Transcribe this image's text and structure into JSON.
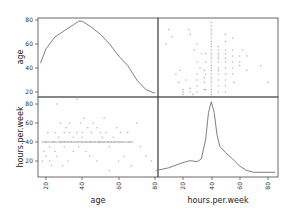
{
  "chart_data": {
    "type": "scatter_matrix",
    "variables": [
      "age",
      "hours.per.week"
    ],
    "grid": false,
    "panels": [
      {
        "position": "top-left",
        "type": "kde",
        "variable": "age",
        "ylabel": "age",
        "yticks": [
          20,
          40,
          60,
          80
        ],
        "curve": [
          [
            17,
            44
          ],
          [
            20,
            56
          ],
          [
            25,
            66
          ],
          [
            30,
            71
          ],
          [
            35,
            76
          ],
          [
            38,
            79
          ],
          [
            40,
            79
          ],
          [
            45,
            74
          ],
          [
            50,
            68
          ],
          [
            55,
            60
          ],
          [
            60,
            50
          ],
          [
            65,
            42
          ],
          [
            70,
            30
          ],
          [
            75,
            22
          ],
          [
            80,
            19
          ]
        ]
      },
      {
        "position": "top-right",
        "type": "scatter",
        "x": "hours.per.week",
        "y": "age",
        "points": [
          [
            8,
            60
          ],
          [
            10,
            72
          ],
          [
            12,
            66
          ],
          [
            15,
            35
          ],
          [
            17,
            28
          ],
          [
            18,
            38
          ],
          [
            20,
            22
          ],
          [
            20,
            18
          ],
          [
            20,
            20
          ],
          [
            22,
            30
          ],
          [
            24,
            72
          ],
          [
            25,
            68
          ],
          [
            25,
            23
          ],
          [
            25,
            20
          ],
          [
            27,
            18
          ],
          [
            28,
            55
          ],
          [
            30,
            60
          ],
          [
            30,
            45
          ],
          [
            30,
            35
          ],
          [
            30,
            30
          ],
          [
            30,
            25
          ],
          [
            30,
            20
          ],
          [
            32,
            40
          ],
          [
            33,
            52
          ],
          [
            35,
            38
          ],
          [
            35,
            32
          ],
          [
            35,
            28
          ],
          [
            35,
            22
          ],
          [
            36,
            52
          ],
          [
            36,
            45
          ],
          [
            36,
            35
          ],
          [
            36,
            22
          ],
          [
            40,
            78
          ],
          [
            40,
            75
          ],
          [
            40,
            72
          ],
          [
            40,
            70
          ],
          [
            40,
            68
          ],
          [
            40,
            65
          ],
          [
            40,
            62
          ],
          [
            40,
            60
          ],
          [
            40,
            58
          ],
          [
            40,
            55
          ],
          [
            40,
            52
          ],
          [
            40,
            50
          ],
          [
            40,
            48
          ],
          [
            40,
            45
          ],
          [
            40,
            42
          ],
          [
            40,
            40
          ],
          [
            40,
            38
          ],
          [
            40,
            35
          ],
          [
            40,
            32
          ],
          [
            40,
            30
          ],
          [
            40,
            28
          ],
          [
            40,
            25
          ],
          [
            40,
            22
          ],
          [
            40,
            20
          ],
          [
            40,
            18
          ],
          [
            45,
            58
          ],
          [
            45,
            55
          ],
          [
            45,
            52
          ],
          [
            45,
            50
          ],
          [
            45,
            48
          ],
          [
            45,
            45
          ],
          [
            45,
            40
          ],
          [
            45,
            38
          ],
          [
            45,
            35
          ],
          [
            45,
            30
          ],
          [
            45,
            25
          ],
          [
            45,
            20
          ],
          [
            50,
            68
          ],
          [
            50,
            62
          ],
          [
            50,
            55
          ],
          [
            50,
            52
          ],
          [
            50,
            48
          ],
          [
            50,
            45
          ],
          [
            50,
            40
          ],
          [
            50,
            35
          ],
          [
            50,
            30
          ],
          [
            50,
            25
          ],
          [
            50,
            20
          ],
          [
            55,
            65
          ],
          [
            55,
            55
          ],
          [
            55,
            50
          ],
          [
            55,
            45
          ],
          [
            55,
            40
          ],
          [
            55,
            35
          ],
          [
            56,
            28
          ],
          [
            60,
            50
          ],
          [
            60,
            45
          ],
          [
            60,
            42
          ],
          [
            62,
            55
          ],
          [
            65,
            50
          ],
          [
            65,
            38
          ],
          [
            75,
            42
          ],
          [
            80,
            28
          ]
        ]
      },
      {
        "position": "bottom-left",
        "type": "scatter",
        "x": "age",
        "y": "hours.per.week",
        "xticks": [
          20,
          40,
          60,
          80
        ],
        "xlabel": "age",
        "ylabel": "hours.per.week",
        "yticks": [
          20,
          40,
          60,
          80
        ],
        "points": [
          [
            18,
            20
          ],
          [
            19,
            30
          ],
          [
            20,
            25
          ],
          [
            20,
            40
          ],
          [
            21,
            50
          ],
          [
            22,
            35
          ],
          [
            22,
            20
          ],
          [
            23,
            15
          ],
          [
            24,
            40
          ],
          [
            25,
            50
          ],
          [
            25,
            30
          ],
          [
            26,
            80
          ],
          [
            26,
            25
          ],
          [
            27,
            45
          ],
          [
            28,
            40
          ],
          [
            28,
            60
          ],
          [
            29,
            15
          ],
          [
            30,
            50
          ],
          [
            30,
            40
          ],
          [
            30,
            35
          ],
          [
            31,
            55
          ],
          [
            32,
            40
          ],
          [
            32,
            20
          ],
          [
            33,
            60
          ],
          [
            33,
            50
          ],
          [
            34,
            40
          ],
          [
            35,
            45
          ],
          [
            35,
            30
          ],
          [
            36,
            40
          ],
          [
            37,
            50
          ],
          [
            37,
            85
          ],
          [
            38,
            40
          ],
          [
            38,
            35
          ],
          [
            39,
            60
          ],
          [
            40,
            50
          ],
          [
            40,
            40
          ],
          [
            40,
            45
          ],
          [
            41,
            65
          ],
          [
            42,
            40
          ],
          [
            42,
            30
          ],
          [
            43,
            55
          ],
          [
            44,
            40
          ],
          [
            44,
            25
          ],
          [
            45,
            50
          ],
          [
            45,
            40
          ],
          [
            46,
            60
          ],
          [
            47,
            40
          ],
          [
            48,
            55
          ],
          [
            48,
            20
          ],
          [
            49,
            40
          ],
          [
            50,
            50
          ],
          [
            50,
            40
          ],
          [
            51,
            45
          ],
          [
            52,
            65
          ],
          [
            52,
            40
          ],
          [
            53,
            50
          ],
          [
            54,
            40
          ],
          [
            55,
            35
          ],
          [
            55,
            10
          ],
          [
            56,
            40
          ],
          [
            57,
            45
          ],
          [
            58,
            40
          ],
          [
            59,
            55
          ],
          [
            60,
            40
          ],
          [
            60,
            20
          ],
          [
            61,
            50
          ],
          [
            62,
            40
          ],
          [
            63,
            25
          ],
          [
            65,
            50
          ],
          [
            66,
            40
          ],
          [
            67,
            15
          ],
          [
            70,
            60
          ],
          [
            72,
            35
          ],
          [
            75,
            25
          ],
          [
            78,
            20
          ]
        ],
        "dense_row": {
          "y": 40,
          "x_range": [
            18,
            68
          ]
        }
      },
      {
        "position": "bottom-right",
        "type": "kde",
        "variable": "hours.per.week",
        "xticks": [
          20,
          40,
          60,
          80
        ],
        "xlabel": "hours.per.week",
        "curve": [
          [
            1,
            5
          ],
          [
            10,
            8
          ],
          [
            20,
            14
          ],
          [
            25,
            16
          ],
          [
            30,
            15
          ],
          [
            33,
            18
          ],
          [
            36,
            40
          ],
          [
            38,
            70
          ],
          [
            40,
            82
          ],
          [
            42,
            70
          ],
          [
            44,
            45
          ],
          [
            46,
            32
          ],
          [
            50,
            25
          ],
          [
            55,
            18
          ],
          [
            60,
            10
          ],
          [
            65,
            5
          ],
          [
            70,
            3
          ],
          [
            80,
            3
          ],
          [
            85,
            3
          ]
        ]
      }
    ]
  },
  "labels": {
    "ylabel_top": "age",
    "ylabel_bottom": "hours.per.week",
    "xlabel_left": "age",
    "xlabel_right": "hours.per.week"
  },
  "ticks": {
    "top_y": [
      "80",
      "60",
      "40",
      "20"
    ],
    "bottom_y": [
      "80",
      "60",
      "40",
      "20"
    ],
    "left_x": [
      "20",
      "40",
      "60",
      "80"
    ],
    "right_x": [
      "20",
      "40",
      "60",
      "80"
    ]
  },
  "colors": {
    "line": "#808080",
    "points": "#9a9a9a",
    "axes": "#444444"
  }
}
